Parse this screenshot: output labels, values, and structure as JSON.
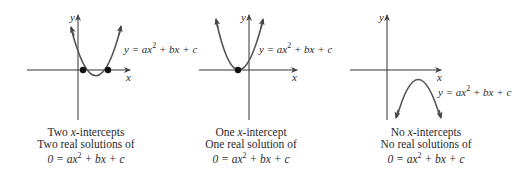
{
  "panels": [
    {
      "id": "two-intercepts",
      "equation": {
        "prefix": "y = ax",
        "exp": "2",
        "suffix": " + bx + c"
      },
      "caption": {
        "line1_pre": "Two ",
        "line1_var": "x",
        "line1_post": "-intercepts",
        "line2": "Two real solutions of",
        "line3": {
          "prefix": "0 = ax",
          "exp": "2",
          "suffix": " + bx + c"
        }
      },
      "axis_x_label": "x",
      "axis_y_label": "y"
    },
    {
      "id": "one-intercept",
      "equation": {
        "prefix": "y = ax",
        "exp": "2",
        "suffix": " + bx + c"
      },
      "caption": {
        "line1_pre": "One ",
        "line1_var": "x",
        "line1_post": "-intercept",
        "line2": "One real solution of",
        "line3": {
          "prefix": "0 = ax",
          "exp": "2",
          "suffix": " + bx + c"
        }
      },
      "axis_x_label": "x",
      "axis_y_label": "y"
    },
    {
      "id": "no-intercepts",
      "equation": {
        "prefix": "y = ax",
        "exp": "2",
        "suffix": " + bx + c"
      },
      "caption": {
        "line1_pre": "No ",
        "line1_var": "x",
        "line1_post": "-intercepts",
        "line2": "No real solutions of",
        "line3": {
          "prefix": "0 = ax",
          "exp": "2",
          "suffix": " + bx + c"
        }
      },
      "axis_x_label": "x",
      "axis_y_label": "y"
    }
  ],
  "colors": {
    "curve": "#555555",
    "axis": "#333333",
    "point": "#111111"
  }
}
